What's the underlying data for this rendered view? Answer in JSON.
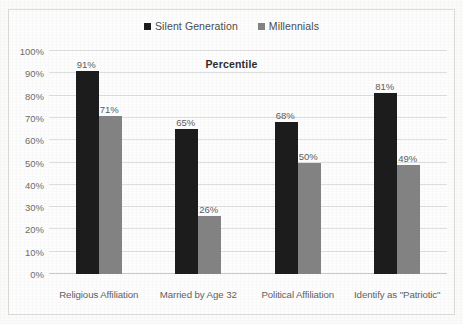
{
  "chart_data": {
    "type": "bar",
    "title": "Percentile",
    "xlabel": "",
    "ylabel": "",
    "ylim": [
      0,
      100
    ],
    "grid": true,
    "legend_position": "top-center",
    "categories": [
      "Religious Affiliation",
      "Married by Age 32",
      "Political Affiliation",
      "Identify as \"Patriotic\""
    ],
    "y_ticks": [
      "0%",
      "10%",
      "20%",
      "30%",
      "40%",
      "50%",
      "60%",
      "70%",
      "80%",
      "90%",
      "100%"
    ],
    "series": [
      {
        "name": "Silent Generation",
        "color": "#1c1c1c",
        "values": [
          91,
          65,
          68,
          81
        ],
        "labels": [
          "91%",
          "65%",
          "68%",
          "81%"
        ]
      },
      {
        "name": "Millennials",
        "color": "#828282",
        "values": [
          71,
          26,
          50,
          49
        ],
        "labels": [
          "71%",
          "26%",
          "50%",
          "49%"
        ]
      }
    ]
  }
}
